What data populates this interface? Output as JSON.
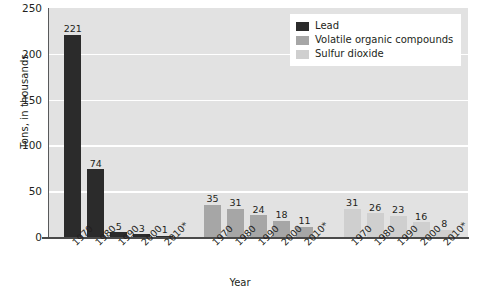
{
  "chart_data": {
    "type": "bar",
    "title": "",
    "xlabel": "Year",
    "ylabel": "Tons, in thousands",
    "categories": [
      "1970",
      "1980",
      "1990",
      "2000",
      "2010*"
    ],
    "ylim": [
      0,
      250
    ],
    "yticks": [
      0,
      50,
      100,
      150,
      200,
      250
    ],
    "grid": true,
    "legend_position": "top-right",
    "grouping": "series-clusters",
    "series": [
      {
        "name": "Lead",
        "color": "#2b2b2b",
        "values": [
          221,
          74,
          5,
          3,
          1
        ]
      },
      {
        "name": "Volatile organic compounds",
        "color": "#a6a6a6",
        "values": [
          35,
          31,
          24,
          18,
          11
        ]
      },
      {
        "name": "Sulfur dioxide",
        "color": "#cfcfcf",
        "values": [
          31,
          26,
          23,
          16,
          8
        ]
      }
    ]
  },
  "axes": {
    "y_title": "Tons, in thousands",
    "x_title": "Year",
    "y_tick_labels": [
      "0",
      "50",
      "100",
      "150",
      "200",
      "250"
    ]
  },
  "legend": {
    "entries": [
      {
        "label": "Lead",
        "color": "#2b2b2b"
      },
      {
        "label": "Volatile organic compounds",
        "color": "#a6a6a6"
      },
      {
        "label": "Sulfur dioxide",
        "color": "#cfcfcf"
      }
    ]
  },
  "colors": {
    "plot_background": "#e2e2e2",
    "gridline": "#ffffff",
    "axis_line": "#58595b",
    "baseline": "#4a4a4a",
    "text": "#231f20",
    "page_background": "#ffffff"
  }
}
